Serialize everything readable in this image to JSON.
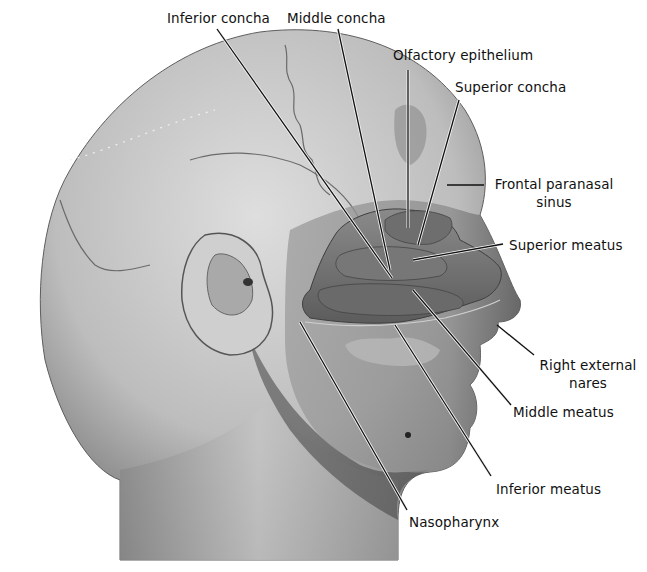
{
  "figure": {
    "colors": {
      "background": "#ffffff",
      "skin_light": "#d9d9d9",
      "skin_mid": "#a8a8a8",
      "skin_dark": "#4a4a4a",
      "cavity": "#7a7a7a",
      "leader_line": "#111111",
      "label_text": "#111111"
    }
  },
  "labels": [
    {
      "id": "inferior-concha",
      "text": "Inferior concha",
      "x": 167,
      "y": 9
    },
    {
      "id": "middle-concha",
      "text": "Middle concha",
      "x": 287,
      "y": 9
    },
    {
      "id": "olfactory-epithelium",
      "text": "Olfactory epithelium",
      "x": 393,
      "y": 46
    },
    {
      "id": "superior-concha",
      "text": "Superior concha",
      "x": 455,
      "y": 78
    },
    {
      "id": "frontal-paranasal-sinus",
      "line1": "Frontal paranasal",
      "line2": "sinus",
      "x": 492,
      "y": 175
    },
    {
      "id": "superior-meatus",
      "text": "Superior meatus",
      "x": 509,
      "y": 236
    },
    {
      "id": "right-external-nares",
      "line1": "Right external",
      "line2": "nares",
      "x": 540,
      "y": 356
    },
    {
      "id": "middle-meatus",
      "text": "Middle meatus",
      "x": 513,
      "y": 403
    },
    {
      "id": "inferior-meatus",
      "text": "Inferior meatus",
      "x": 496,
      "y": 480
    },
    {
      "id": "nasopharynx",
      "text": "Nasopharynx",
      "x": 409,
      "y": 513
    }
  ]
}
